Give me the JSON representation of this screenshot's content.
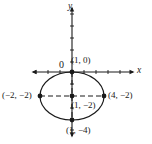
{
  "figure": {
    "type": "coordinate-plane-ellipse-graph",
    "background_color": "#ffffff",
    "stroke_color": "#1a1a1a"
  },
  "axes": {
    "x_label": "x",
    "y_label": "y",
    "origin_label": "0",
    "x_axis": {
      "y_px": 72,
      "x_start_px": 33,
      "x_end_px": 133,
      "arrow_left": true,
      "arrow_right": true
    },
    "y_axis": {
      "x_px": 72,
      "y_start_px": 8,
      "y_end_px": 136,
      "arrow_top": true,
      "arrow_bottom": true
    },
    "tick_spacing_px": 12,
    "tick_length_px": 4
  },
  "ellipse": {
    "center_px": {
      "x": 72,
      "y": 96
    },
    "semi_axis_x_px": 32,
    "semi_axis_y_px": 24,
    "center_math": {
      "x": 1,
      "y": -2
    },
    "semi_axis_x_math": 3,
    "semi_axis_y_math": 2
  },
  "points": [
    {
      "id": "top",
      "label": "(1, 0)",
      "px": {
        "x": 72,
        "y": 72
      },
      "math": {
        "x": 1,
        "y": 0
      }
    },
    {
      "id": "left",
      "label": "(−2, −2)",
      "px": {
        "x": 40,
        "y": 96
      },
      "math": {
        "x": -2,
        "y": -2
      }
    },
    {
      "id": "right",
      "label": "(4, −2)",
      "px": {
        "x": 104,
        "y": 96
      },
      "math": {
        "x": 4,
        "y": -2
      }
    },
    {
      "id": "center",
      "label": "(1, −2)",
      "px": {
        "x": 72,
        "y": 96
      },
      "math": {
        "x": 1,
        "y": -2
      }
    },
    {
      "id": "bottom",
      "label": "(1, −4)",
      "px": {
        "x": 72,
        "y": 120
      },
      "math": {
        "x": 1,
        "y": -4
      }
    }
  ],
  "dashed_guides": {
    "horizontal": {
      "from_px": {
        "x": 40,
        "y": 96
      },
      "to_px": {
        "x": 104,
        "y": 96
      }
    },
    "vertical": {
      "from_px": {
        "x": 72,
        "y": 72
      },
      "to_px": {
        "x": 72,
        "y": 120
      }
    },
    "dash_pattern": "5,3"
  }
}
